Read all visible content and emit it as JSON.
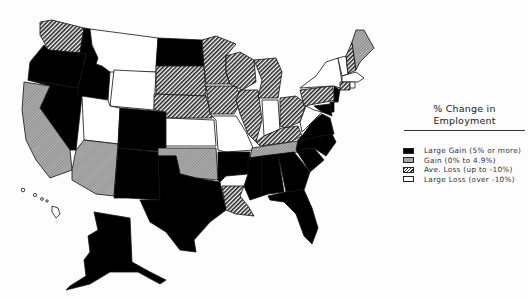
{
  "legend": {
    "title_line1": "% Change in",
    "title_line2": "Employment",
    "categories": [
      {
        "key": "large_gain",
        "label": "Large Gain (5% or more)"
      },
      {
        "key": "gain",
        "label": "Gain (0% to 4.9%)"
      },
      {
        "key": "ave_loss",
        "label": "Ave. Loss (up to -10%)"
      },
      {
        "key": "large_loss",
        "label": "Large Loss (over -10%)"
      }
    ]
  },
  "colors": {
    "large_gain": "#000000",
    "gain": "#a8a8a8",
    "ave_loss": "hatch",
    "large_loss": "#ffffff",
    "outline": "#111111"
  },
  "states": {
    "WA": "ave_loss",
    "OR": "large_gain",
    "CA": "gain",
    "NV": "large_gain",
    "ID": "large_gain",
    "MT": "large_loss",
    "WY": "large_loss",
    "UT": "large_loss",
    "AZ": "gain",
    "CO": "large_gain",
    "NM": "large_gain",
    "ND": "large_gain",
    "SD": "ave_loss",
    "NE": "ave_loss",
    "KS": "large_loss",
    "OK": "gain",
    "TX": "large_gain",
    "MN": "ave_loss",
    "IA": "ave_loss",
    "MO": "large_loss",
    "AR": "large_gain",
    "LA": "ave_loss",
    "WI": "ave_loss",
    "IL": "ave_loss",
    "MI": "ave_loss",
    "IN": "large_loss",
    "OH": "ave_loss",
    "KY": "ave_loss",
    "TN": "gain",
    "MS": "large_gain",
    "AL": "large_gain",
    "GA": "large_gain",
    "FL": "large_gain",
    "SC": "large_gain",
    "NC": "large_gain",
    "VA": "large_gain",
    "WV": "large_loss",
    "PA": "ave_loss",
    "NY": "large_loss",
    "VT": "large_loss",
    "NH": "ave_loss",
    "ME": "gain",
    "MA": "large_loss",
    "CT": "ave_loss",
    "RI": "large_loss",
    "NJ": "large_gain",
    "DE": "large_gain",
    "MD": "large_gain",
    "AK": "large_gain",
    "HI": "large_loss"
  }
}
